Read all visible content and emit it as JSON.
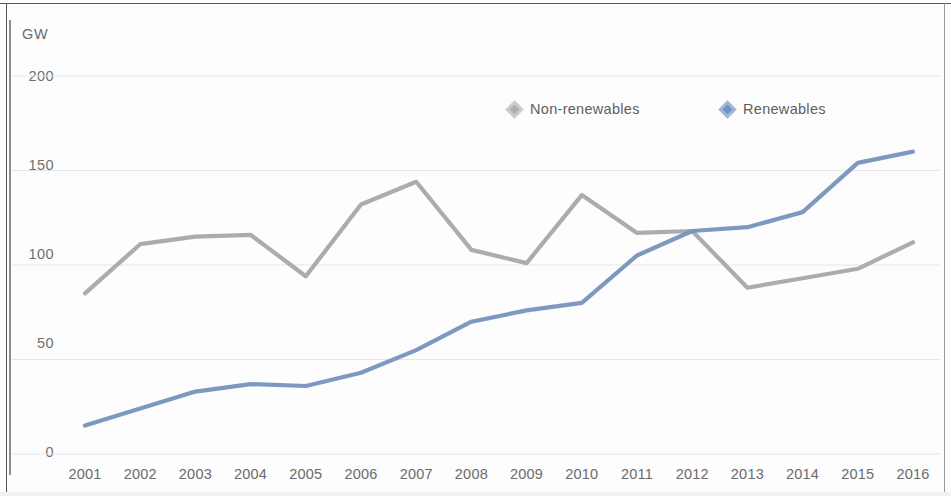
{
  "chart_data": {
    "type": "line",
    "title": "",
    "subtitle": "",
    "xlabel": "",
    "ylabel": "GW",
    "unit_label": "GW",
    "categories": [
      "2001",
      "2002",
      "2003",
      "2004",
      "2005",
      "2006",
      "2007",
      "2008",
      "2009",
      "2010",
      "2011",
      "2012",
      "2013",
      "2014",
      "2015",
      "2016"
    ],
    "ylim": [
      0,
      200
    ],
    "yticks": [
      0,
      50,
      100,
      150,
      200
    ],
    "grid": true,
    "legend_position": "top-center",
    "series": [
      {
        "name": "Non-renewables",
        "color": "#a8a8a8",
        "marker": "diamond",
        "values": [
          85,
          111,
          115,
          116,
          94,
          132,
          144,
          108,
          101,
          137,
          117,
          118,
          88,
          93,
          98,
          112
        ]
      },
      {
        "name": "Renewables",
        "color": "#7694bd",
        "marker": "diamond",
        "values": [
          15,
          24,
          33,
          37,
          36,
          43,
          55,
          70,
          76,
          80,
          105,
          118,
          120,
          128,
          154,
          160
        ]
      }
    ]
  },
  "axes": {
    "y_tick_labels": [
      "0",
      "50",
      "100",
      "150",
      "200"
    ],
    "x_tick_labels": [
      "2001",
      "2002",
      "2003",
      "2004",
      "2005",
      "2006",
      "2007",
      "2008",
      "2009",
      "2010",
      "2011",
      "2012",
      "2013",
      "2014",
      "2015",
      "2016"
    ]
  },
  "legend": {
    "items": [
      {
        "label": "Non-renewables",
        "color": "#b0b0b0"
      },
      {
        "label": "Renewables",
        "color": "#6f93c4"
      }
    ]
  },
  "colors": {
    "non_renewables": "#a8a8a8",
    "renewables": "#7694bd",
    "grid": "#e6e6e6",
    "text": "#6b6b6b",
    "background": "#fdfdfd"
  }
}
